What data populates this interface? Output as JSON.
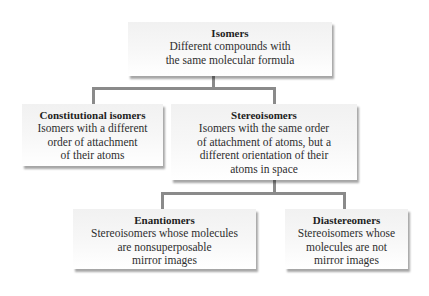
{
  "diagram": {
    "type": "hierarchy",
    "connector_color": "#8a8a8a",
    "nodes": {
      "isomers": {
        "title": "Isomers",
        "lines": [
          "Different compounds with",
          "the same molecular formula"
        ]
      },
      "constitutional": {
        "title": "Constitutional isomers",
        "lines": [
          "Isomers with a different",
          "order of attachment",
          "of their atoms"
        ]
      },
      "stereoisomers": {
        "title": "Stereoisomers",
        "lines": [
          "Isomers with the same order",
          "of attachment of atoms, but a",
          "different orientation of their",
          "atoms in space"
        ]
      },
      "enantiomers": {
        "title": "Enantiomers",
        "lines": [
          "Stereoisomers whose molecules",
          "are nonsuperposable",
          "mirror images"
        ]
      },
      "diastereomers": {
        "title": "Diastereomers",
        "lines": [
          "Stereoisomers whose",
          "molecules are not",
          "mirror images"
        ]
      }
    },
    "edges": [
      [
        "isomers",
        "constitutional"
      ],
      [
        "isomers",
        "stereoisomers"
      ],
      [
        "stereoisomers",
        "enantiomers"
      ],
      [
        "stereoisomers",
        "diastereomers"
      ]
    ]
  }
}
